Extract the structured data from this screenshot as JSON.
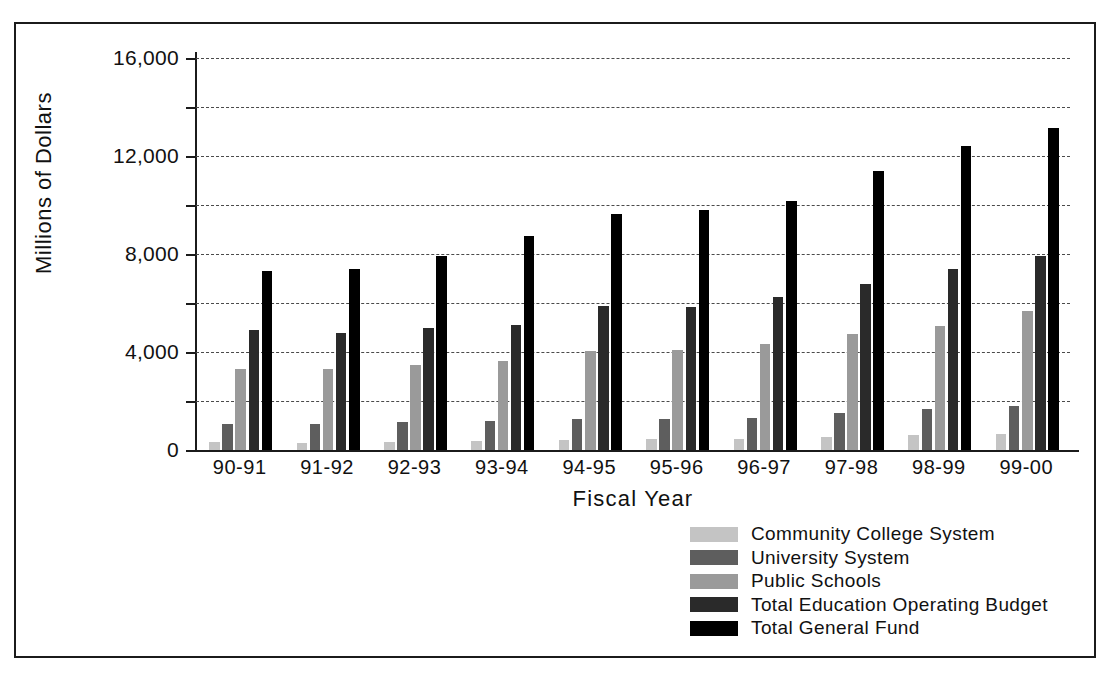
{
  "chart_data": {
    "type": "bar",
    "title": "",
    "xlabel": "Fiscal Year",
    "ylabel": "Millions of Dollars",
    "ylim": [
      0,
      16000
    ],
    "ytick_labels": [
      "0",
      "4,000",
      "8,000",
      "12,000",
      "16,000"
    ],
    "ytick_values": [
      0,
      4000,
      8000,
      12000,
      16000
    ],
    "minor_gridline_values": [
      2000,
      6000,
      10000,
      14000
    ],
    "grid": true,
    "legend_position": "bottom-center",
    "categories": [
      "90-91",
      "91-92",
      "92-93",
      "93-94",
      "94-95",
      "95-96",
      "96-97",
      "97-98",
      "98-99",
      "99-00"
    ],
    "series": [
      {
        "name": "Community College System",
        "color": "#c4c4c4",
        "values": [
          310,
          300,
          320,
          370,
          400,
          430,
          450,
          520,
          600,
          660
        ]
      },
      {
        "name": "University System",
        "color": "#5e5e5e",
        "values": [
          1050,
          1050,
          1150,
          1200,
          1250,
          1280,
          1320,
          1520,
          1680,
          1780
        ]
      },
      {
        "name": "Public Schools",
        "color": "#9a9a9a",
        "values": [
          3300,
          3300,
          3450,
          3650,
          4050,
          4080,
          4330,
          4720,
          5080,
          5660
        ]
      },
      {
        "name": "Total Education Operating Budget",
        "color": "#2a2a2a",
        "values": [
          4880,
          4760,
          4980,
          5120,
          5860,
          5850,
          6230,
          6790,
          7400,
          7900
        ]
      },
      {
        "name": "Total General Fund",
        "color": "#000000",
        "values": [
          7300,
          7400,
          7930,
          8740,
          9650,
          9800,
          10150,
          11400,
          12400,
          13150
        ]
      }
    ]
  },
  "figure": {
    "ytitle": "Millions of Dollars",
    "xtitle": "Fiscal Year"
  }
}
